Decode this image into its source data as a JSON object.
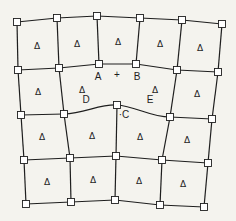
{
  "diagram": {
    "type": "quadrilateral-mesh",
    "colors": {
      "line": "#1e1e1e",
      "node_fill": "#ffffff",
      "background": "#f4f3ee"
    },
    "cell_marker": "Δ",
    "rows": [
      [
        [
          17,
          22
        ],
        [
          57,
          18
        ],
        [
          97,
          16
        ],
        [
          140,
          18
        ],
        [
          182,
          20
        ],
        [
          222,
          24
        ]
      ],
      [
        [
          18,
          70
        ],
        [
          59,
          68
        ],
        [
          99,
          64
        ],
        [
          136,
          64
        ],
        [
          177,
          70
        ],
        [
          218,
          72
        ]
      ],
      [
        [
          21,
          115
        ],
        [
          64,
          114
        ],
        [
          117,
          105
        ],
        [
          170,
          117
        ],
        [
          212,
          119
        ]
      ],
      [
        [
          24,
          160
        ],
        [
          70,
          158
        ],
        [
          116,
          156
        ],
        [
          162,
          160
        ],
        [
          208,
          163
        ]
      ],
      [
        [
          26,
          204
        ],
        [
          71,
          202
        ],
        [
          115,
          200
        ],
        [
          160,
          205
        ],
        [
          204,
          207
        ]
      ]
    ],
    "curve_path": "M64,114 C85,113 100,104 117,105 C135,106 150,117 170,117",
    "triangles": [
      [
        37,
        46
      ],
      [
        77,
        44
      ],
      [
        118,
        42
      ],
      [
        160,
        44
      ],
      [
        200,
        48
      ],
      [
        38,
        92
      ],
      [
        82,
        90
      ],
      [
        155,
        90
      ],
      [
        197,
        94
      ],
      [
        42,
        137
      ],
      [
        92,
        136
      ],
      [
        140,
        137
      ],
      [
        187,
        140
      ],
      [
        47,
        182
      ],
      [
        93,
        180
      ],
      [
        139,
        181
      ],
      [
        183,
        184
      ]
    ],
    "labels": [
      {
        "id": "A",
        "text": "A",
        "x": 98,
        "y": 80
      },
      {
        "id": "plus",
        "text": "+",
        "x": 117,
        "y": 78
      },
      {
        "id": "B",
        "text": "B",
        "x": 137,
        "y": 80
      },
      {
        "id": "D",
        "text": "D",
        "x": 86,
        "y": 103
      },
      {
        "id": "E",
        "text": "E",
        "x": 150,
        "y": 103
      },
      {
        "id": "C",
        "text": "·C",
        "x": 124,
        "y": 118
      }
    ]
  }
}
